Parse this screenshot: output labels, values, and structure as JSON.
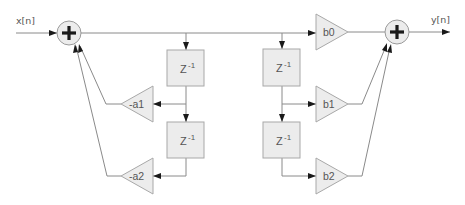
{
  "diagram": {
    "type": "IIR biquad filter block diagram (Direct Form I)",
    "input_label": "x[n]",
    "output_label": "y[n]",
    "delays": [
      {
        "label": "Z",
        "exponent": "-1"
      },
      {
        "label": "Z",
        "exponent": "-1"
      },
      {
        "label": "Z",
        "exponent": "-1"
      },
      {
        "label": "Z",
        "exponent": "-1"
      }
    ],
    "feedback_gains": [
      "-a1",
      "-a2"
    ],
    "feedforward_gains": [
      "b0",
      "b1",
      "b2"
    ],
    "adders": [
      "input-adder",
      "output-adder"
    ],
    "colors": {
      "block_fill": "#ececec",
      "block_stroke": "#a8a8a8",
      "wire": "#8a8a8a",
      "plus": "#1a1a1a",
      "text": "#555555"
    }
  }
}
